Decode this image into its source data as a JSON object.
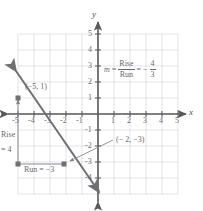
{
  "figure": {
    "type": "line-graph-slope",
    "axes": {
      "x_label": "x",
      "y_label": "y",
      "x_ticks": [
        "-5",
        "-4",
        "-3",
        "-2",
        "-1",
        "1",
        "2",
        "3",
        "4",
        "5"
      ],
      "y_ticks": [
        "5",
        "4",
        "3",
        "2",
        "1",
        "-1",
        "-2",
        "-3",
        "-4"
      ],
      "x_range": [
        -6,
        6
      ],
      "y_range": [
        -5,
        6
      ],
      "grid": true
    },
    "formula": {
      "variable": "m",
      "equals_1": "=",
      "fraction_1_num": "Rise",
      "fraction_1_den": "Run",
      "equals_2": "=",
      "sign": "−",
      "fraction_2_num": "4",
      "fraction_2_den": "3"
    },
    "annotations": {
      "point_a_label": "(−5, 1)",
      "point_b_label": "(− 2,  −3)",
      "rise_line_1": "Rise",
      "rise_line_2": "= 4",
      "run_label": "Run = −3"
    },
    "points": [
      {
        "name": "point-a",
        "x": -5,
        "y": 1
      },
      {
        "name": "point-b",
        "x": -2,
        "y": -3
      }
    ],
    "line": {
      "slope": -1.3333,
      "intercept": -5.6667,
      "arrows": "both"
    },
    "colors": {
      "grid": "#d7d7dc",
      "axis": "#58585a",
      "line": "#6f6f74",
      "text": "#6a6a6c"
    }
  }
}
